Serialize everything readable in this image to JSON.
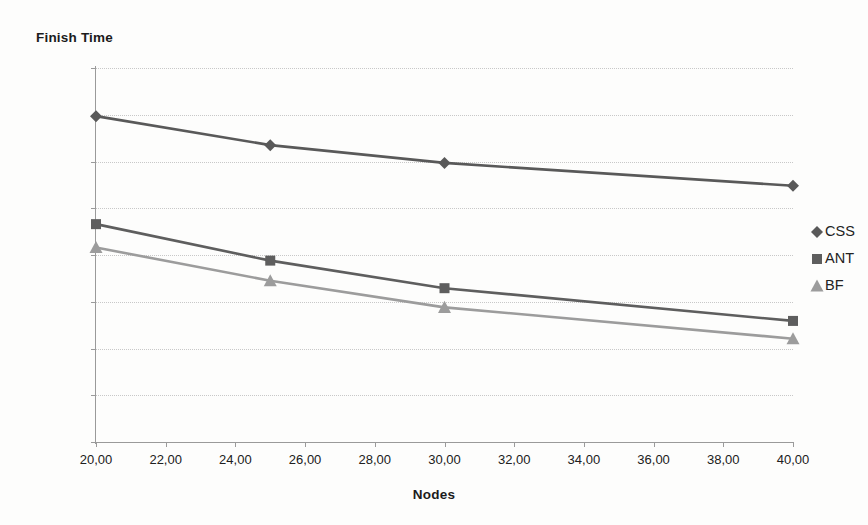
{
  "chart_data": {
    "type": "line",
    "title": "",
    "ylabel": "Finish Time",
    "xlabel": "Nodes",
    "xlim": [
      20,
      40
    ],
    "ylim": [
      0,
      800
    ],
    "grid": true,
    "legend_position": "right",
    "x": [
      20,
      25,
      30,
      40
    ],
    "xticks": [
      20,
      22,
      24,
      26,
      28,
      30,
      32,
      34,
      36,
      38,
      40
    ],
    "xtick_labels": [
      "20,00",
      "22,00",
      "24,00",
      "26,00",
      "28,00",
      "30,00",
      "32,00",
      "34,00",
      "36,00",
      "38,00",
      "40,00"
    ],
    "yticks": [
      0,
      100,
      200,
      300,
      400,
      500,
      600,
      700,
      800
    ],
    "ytick_labels": [
      "0,00",
      "100,00",
      "200,00",
      "300,00",
      "400,00",
      "500,00",
      "600,00",
      "700,00",
      "800,00"
    ],
    "series": [
      {
        "name": "CSS",
        "marker": "diamond",
        "color": "#595959",
        "values": [
          697,
          635,
          597,
          548
        ]
      },
      {
        "name": "ANT",
        "marker": "square",
        "color": "#5e5e5e",
        "values": [
          466,
          388,
          329,
          259
        ]
      },
      {
        "name": "BF",
        "marker": "triangle",
        "color": "#9c9c9c",
        "values": [
          416,
          345,
          288,
          221
        ]
      }
    ]
  },
  "legend": {
    "items": [
      {
        "label": "CSS",
        "marker": "diamond",
        "color": "#595959"
      },
      {
        "label": "ANT",
        "marker": "square",
        "color": "#5e5e5e"
      },
      {
        "label": "BF",
        "marker": "triangle",
        "color": "#9c9c9c"
      }
    ]
  },
  "colors": {
    "background": "#fdfdfc",
    "axis": "#9a9a9a",
    "gridline": "#c8c8c8",
    "text": "#1b1b1b"
  }
}
